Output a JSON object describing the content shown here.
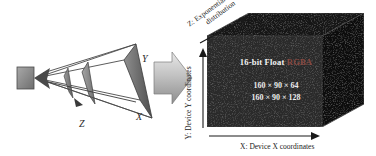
{
  "figure": {
    "background_color": "#ffffff"
  },
  "left_diagram": {
    "name": "view-frustum",
    "description": "Perspective camera frustum with eye point, near/far clip planes and two interior slice planes",
    "axis_labels": {
      "x": "X",
      "y": "Y",
      "z": "Z"
    },
    "colors": {
      "plane_fill_dark": "#6d6d6d",
      "plane_fill_light": "#b9b9b9",
      "edge": "#3a3a3a",
      "eye_block": "#8a8a8a"
    }
  },
  "transition": {
    "arrow_name": "right-arrow",
    "glyph": "➡",
    "color_light": "#d8d8d8",
    "color_dark": "#9a9a9a"
  },
  "right_diagram": {
    "name": "device-coordinate-volume",
    "cube": {
      "front_face_color": "#2b2b2b",
      "top_face_color": "#1b1b1b",
      "right_face_color": "#101010",
      "edge_color": "#3c3c3c"
    },
    "cube_labels": {
      "format_prefix": "16-bit Float ",
      "format_channels": "RGBA",
      "format_channels_color": "#8a4a42",
      "dimensions": [
        "160 × 90 × 64",
        "160 × 90 × 128"
      ]
    },
    "axes": [
      {
        "id": "z",
        "axis_letter": "Z",
        "caption_line_1": "Z: Exponential depth",
        "caption_line_2": "distribution",
        "orientation": "diagonal-up-right",
        "has_arrowhead": true
      },
      {
        "id": "y",
        "axis_letter": "Y",
        "caption": "Y: Device Y coordinates",
        "orientation": "vertical-up",
        "has_arrowhead": true
      },
      {
        "id": "x",
        "axis_letter": "X",
        "caption": "X: Device X coordinates",
        "orientation": "horizontal-right",
        "has_arrowhead": true
      }
    ]
  }
}
